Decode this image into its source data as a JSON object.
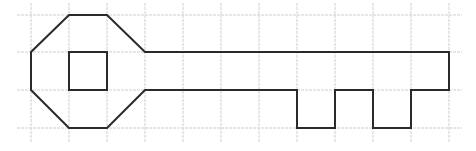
{
  "figure": {
    "grid": {
      "cell_size": 38,
      "vertical_lines_x": [
        31,
        69,
        107,
        145,
        183,
        221,
        259,
        297,
        335,
        373,
        411,
        449
      ],
      "horizontal_lines_y": [
        15,
        52,
        90,
        128
      ],
      "x_extent": [
        17,
        462
      ],
      "y_extent": [
        3,
        142
      ],
      "color": "#cfcfcf"
    },
    "key_outline": {
      "stroke": "#2a2a2a",
      "points": [
        [
          69,
          15
        ],
        [
          107,
          15
        ],
        [
          145,
          52
        ],
        [
          449,
          52
        ],
        [
          449,
          90
        ],
        [
          411,
          90
        ],
        [
          411,
          128
        ],
        [
          373,
          128
        ],
        [
          373,
          90
        ],
        [
          335,
          90
        ],
        [
          335,
          128
        ],
        [
          297,
          128
        ],
        [
          297,
          90
        ],
        [
          145,
          90
        ],
        [
          107,
          128
        ],
        [
          69,
          128
        ],
        [
          31,
          90
        ],
        [
          31,
          52
        ]
      ]
    },
    "inner_square": {
      "stroke": "#2a2a2a",
      "x": 69,
      "y": 52,
      "width": 38,
      "height": 38
    }
  }
}
